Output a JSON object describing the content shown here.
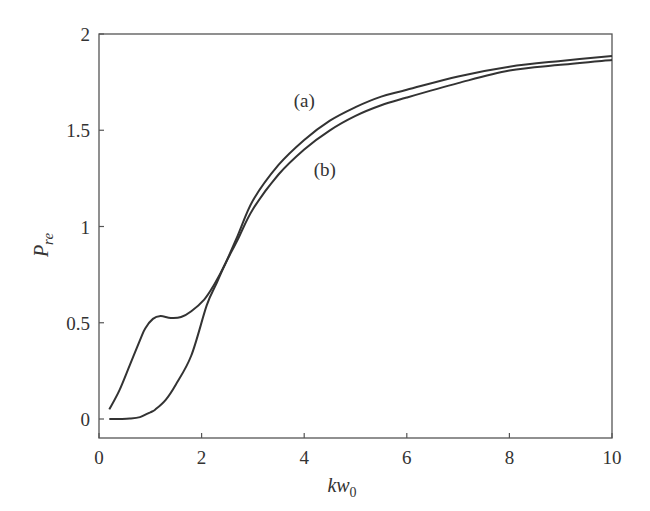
{
  "chart_data": {
    "type": "line",
    "title": "",
    "xlabel": "kw0",
    "ylabel": "Pre",
    "xlim": [
      0,
      10
    ],
    "ylim": [
      -0.1,
      2
    ],
    "grid": false,
    "legend": null,
    "xticks": [
      0,
      2,
      4,
      6,
      8,
      10
    ],
    "yticks": [
      0,
      0.5,
      1,
      1.5,
      2
    ],
    "xtick_labels": [
      "0",
      "2",
      "4",
      "6",
      "8",
      "10"
    ],
    "ytick_labels": [
      "0",
      "0.5",
      "1",
      "1.5",
      "2"
    ],
    "annotations": [
      {
        "text": "(a)",
        "x": 4.0,
        "y": 1.62
      },
      {
        "text": "(b)",
        "x": 4.4,
        "y": 1.26
      }
    ],
    "series": [
      {
        "name": "(a)",
        "x": [
          0.2,
          0.4,
          0.6,
          0.8,
          0.9,
          1.05,
          1.2,
          1.4,
          1.6,
          1.8,
          2.05,
          2.25,
          2.45,
          2.7,
          3.0,
          3.5,
          4.0,
          4.5,
          5.0,
          5.5,
          6.0,
          7.0,
          8.0,
          9.0,
          10.0
        ],
        "y": [
          0.05,
          0.15,
          0.28,
          0.41,
          0.47,
          0.52,
          0.535,
          0.525,
          0.53,
          0.56,
          0.62,
          0.7,
          0.8,
          0.95,
          1.135,
          1.32,
          1.45,
          1.55,
          1.62,
          1.675,
          1.71,
          1.78,
          1.83,
          1.86,
          1.885
        ]
      },
      {
        "name": "(b)",
        "x": [
          0.2,
          0.4,
          0.6,
          0.8,
          1.0,
          1.1,
          1.3,
          1.5,
          1.8,
          2.1,
          2.3,
          2.45,
          2.7,
          3.0,
          3.5,
          4.0,
          4.5,
          5.0,
          5.5,
          6.0,
          7.0,
          8.0,
          9.0,
          10.0
        ],
        "y": [
          0.0,
          0.0,
          0.002,
          0.01,
          0.035,
          0.05,
          0.1,
          0.18,
          0.33,
          0.59,
          0.71,
          0.8,
          0.93,
          1.09,
          1.27,
          1.4,
          1.5,
          1.575,
          1.63,
          1.67,
          1.745,
          1.81,
          1.84,
          1.865
        ]
      }
    ]
  },
  "colors": {
    "line": "#333333",
    "axis": "#555555",
    "background": "#ffffff"
  }
}
